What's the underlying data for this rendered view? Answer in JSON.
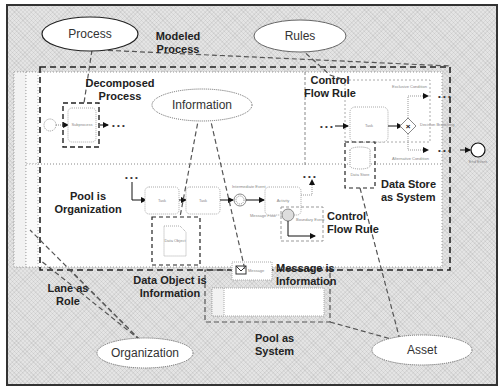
{
  "concepts": {
    "process": "Process",
    "rules": "Rules",
    "information": "Information",
    "organization": "Organization",
    "asset": "Asset"
  },
  "labels": {
    "modeled_process_1": "Modeled",
    "modeled_process_2": "Process",
    "decomposed_process_1": "Decomposed",
    "decomposed_process_2": "Process",
    "control_flow_rule_top_1": "Control",
    "control_flow_rule_top_2": "Flow Rule",
    "pool_is_org_1": "Pool is",
    "pool_is_org_2": "Organization",
    "data_store_1": "Data Store",
    "data_store_2": "as System",
    "control_flow_rule_bottom_1": "Control",
    "control_flow_rule_bottom_2": "Flow Rule",
    "lane_as_role_1": "Lane as",
    "lane_as_role_2": "Role",
    "data_object_1": "Data Object is",
    "data_object_2": "Information",
    "message_info_1": "Message is",
    "message_info_2": "Information",
    "pool_as_system_1": "Pool as",
    "pool_as_system_2": "System"
  },
  "bpmn": {
    "start_event": "Start Event",
    "subprocess": "Subprocess",
    "task_1": "Task",
    "task_2": "Task",
    "task_3": "Task",
    "activity": "Activity",
    "decision": "Decision Branching",
    "exclusive_condition": "Exclusive Condition",
    "alt_condition": "Alternative Condition",
    "data_store": "Data Store",
    "end_event": "End Event",
    "intermediate_event": "Intermediate Event",
    "boundary_event": "Boundary Event",
    "message_flow": "Message Flow",
    "data_object": "Data Object",
    "message": "Message",
    "lane": "Lane",
    "pool": "Pool",
    "ellipsis": "• • •"
  }
}
